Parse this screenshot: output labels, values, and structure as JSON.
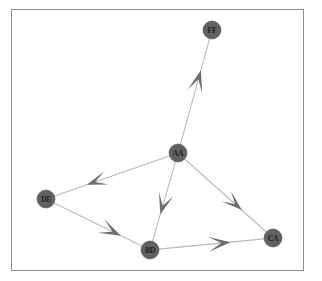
{
  "figure": {
    "frame": {
      "x": 11,
      "y": 9,
      "width": 293,
      "height": 262,
      "border_color": "#8d8d8d"
    },
    "background_color": "#ffffff"
  },
  "chart_data": {
    "type": "diagram",
    "subtype": "directed-graph",
    "title": "",
    "xlabel": "",
    "ylabel": "",
    "grid": false,
    "legend": null,
    "node_style": {
      "fill_color": "#616161",
      "stroke_color": "#4b4b4b",
      "radius": 9,
      "label_color": "#1e1e1e"
    },
    "edge_style": {
      "line_color": "#b9b9b9",
      "line_width": 1.05,
      "arrow_color": "#6e6e6e",
      "arrow_style": "large-triangle-midpoint"
    },
    "nodes": [
      {
        "id": "FF",
        "label": "FF",
        "x": 212,
        "y": 30
      },
      {
        "id": "AA",
        "label": "AA",
        "x": 178,
        "y": 153
      },
      {
        "id": "DE",
        "label": "DE",
        "x": 46,
        "y": 199
      },
      {
        "id": "BD",
        "label": "BD",
        "x": 150,
        "y": 250
      },
      {
        "id": "CA",
        "label": "CA",
        "x": 273,
        "y": 238
      }
    ],
    "edges": [
      {
        "source": "AA",
        "target": "FF",
        "directed": true,
        "arrow_t": 0.7,
        "arrow_size": 22,
        "arrow_spread": 15
      },
      {
        "source": "AA",
        "target": "DE",
        "directed": true,
        "arrow_t": 0.72,
        "arrow_size": 21,
        "arrow_spread": 14
      },
      {
        "source": "AA",
        "target": "BD",
        "directed": true,
        "arrow_t": 0.66,
        "arrow_size": 21,
        "arrow_spread": 15
      },
      {
        "source": "AA",
        "target": "CA",
        "directed": true,
        "arrow_t": 0.7,
        "arrow_size": 21,
        "arrow_spread": 14
      },
      {
        "source": "DE",
        "target": "BD",
        "directed": true,
        "arrow_t": 0.76,
        "arrow_size": 22,
        "arrow_spread": 15
      },
      {
        "source": "BD",
        "target": "CA",
        "directed": true,
        "arrow_t": 0.68,
        "arrow_size": 22,
        "arrow_spread": 15
      }
    ]
  }
}
